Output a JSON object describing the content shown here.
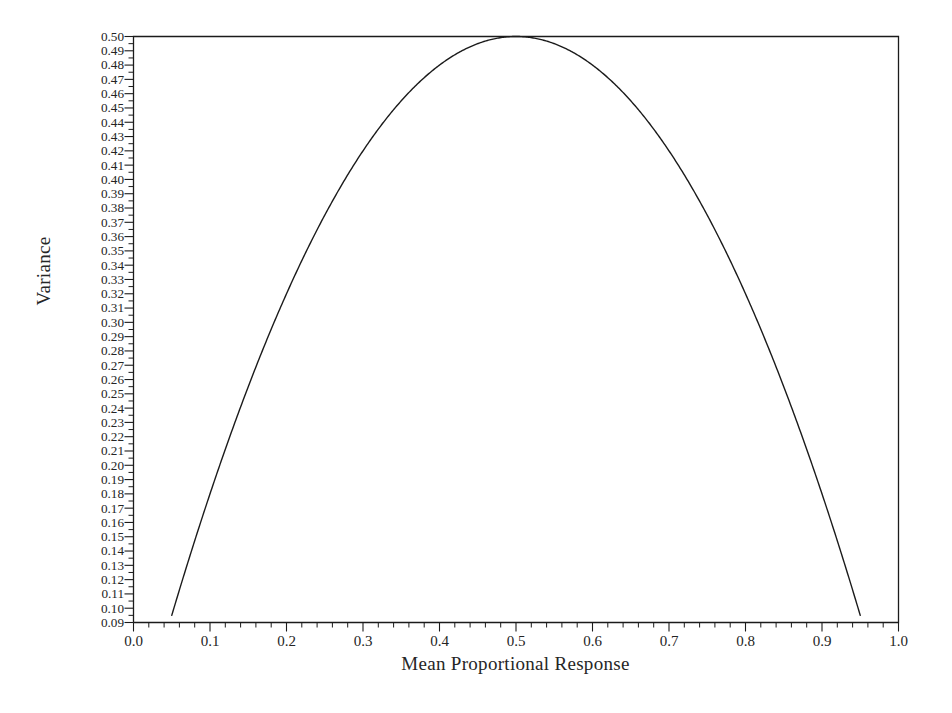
{
  "chart_data": {
    "type": "line",
    "title": "",
    "xlabel": "Mean Proportional Response",
    "ylabel": "Variance",
    "xlim": [
      0.0,
      1.0
    ],
    "ylim": [
      0.09,
      0.5
    ],
    "grid": false,
    "legend": null,
    "line_color": "#1b1b1b",
    "line_width": 1.4,
    "xticks": [
      0.0,
      0.1,
      0.2,
      0.3,
      0.4,
      0.5,
      0.6,
      0.7,
      0.8,
      0.9,
      1.0
    ],
    "xtick_labels": [
      "0.0",
      "0.1",
      "0.2",
      "0.3",
      "0.4",
      "0.5",
      "0.6",
      "0.7",
      "0.8",
      "0.9",
      "1.0"
    ],
    "x_minor_tick_step": 0.02,
    "yticks": [
      0.5,
      0.49,
      0.48,
      0.47,
      0.46,
      0.45,
      0.44,
      0.43,
      0.42,
      0.41,
      0.4,
      0.39,
      0.38,
      0.37,
      0.36,
      0.35,
      0.34,
      0.33,
      0.32,
      0.31,
      0.3,
      0.29,
      0.28,
      0.27,
      0.26,
      0.25,
      0.24,
      0.23,
      0.22,
      0.21,
      0.2,
      0.19,
      0.18,
      0.17,
      0.16,
      0.15,
      0.14,
      0.13,
      0.12,
      0.11,
      0.1,
      0.09
    ],
    "ytick_labels": [
      "0.50",
      "0.49",
      "0.48",
      "0.47",
      "0.46",
      "0.45",
      "0.44",
      "0.43",
      "0.42",
      "0.41",
      "0.40",
      "0.39",
      "0.38",
      "0.37",
      "0.36",
      "0.35",
      "0.34",
      "0.33",
      "0.32",
      "0.31",
      "0.30",
      "0.29",
      "0.28",
      "0.27",
      "0.26",
      "0.25",
      "0.24",
      "0.23",
      "0.22",
      "0.21",
      "0.20",
      "0.19",
      "0.18",
      "0.17",
      "0.16",
      "0.15",
      "0.14",
      "0.13",
      "0.12",
      "0.11",
      "0.10",
      "0.09"
    ],
    "y_minor_tick_step": 0.005,
    "series": [
      {
        "name": "p(1-p)",
        "x": [
          0.05,
          0.06,
          0.07,
          0.08,
          0.09,
          0.1,
          0.11,
          0.12,
          0.13,
          0.14,
          0.15,
          0.16,
          0.17,
          0.18,
          0.19,
          0.2,
          0.21,
          0.22,
          0.23,
          0.24,
          0.25,
          0.26,
          0.27,
          0.28,
          0.29,
          0.3,
          0.31,
          0.32,
          0.33,
          0.34,
          0.35,
          0.36,
          0.37,
          0.38,
          0.39,
          0.4,
          0.41,
          0.42,
          0.43,
          0.44,
          0.45,
          0.46,
          0.47,
          0.48,
          0.49,
          0.5,
          0.51,
          0.52,
          0.53,
          0.54,
          0.55,
          0.56,
          0.57,
          0.58,
          0.59,
          0.6,
          0.61,
          0.62,
          0.63,
          0.64,
          0.65,
          0.66,
          0.67,
          0.68,
          0.69,
          0.7,
          0.71,
          0.72,
          0.73,
          0.74,
          0.75,
          0.76,
          0.77,
          0.78,
          0.79,
          0.8,
          0.81,
          0.82,
          0.83,
          0.84,
          0.85,
          0.86,
          0.87,
          0.88,
          0.89,
          0.9,
          0.91,
          0.92,
          0.93,
          0.94,
          0.95
        ],
        "y": [
          0.095,
          0.0564,
          0.0651,
          0.0736,
          0.0819,
          0.09,
          0.0979,
          0.1056,
          0.1131,
          0.1204,
          0.1275,
          0.1344,
          0.1411,
          0.1476,
          0.1539,
          0.16,
          0.1659,
          0.1716,
          0.1771,
          0.1824,
          0.1875,
          0.1924,
          0.1971,
          0.2016,
          0.2059,
          0.21,
          0.2139,
          0.2176,
          0.2211,
          0.2244,
          0.2275,
          0.2304,
          0.2331,
          0.2356,
          0.2379,
          0.24,
          0.2419,
          0.2436,
          0.2451,
          0.2464,
          0.2475,
          0.2484,
          0.2491,
          0.2496,
          0.2499,
          0.25,
          0.2499,
          0.2496,
          0.2491,
          0.2484,
          0.2475,
          0.2464,
          0.2451,
          0.2436,
          0.2419,
          0.24,
          0.2379,
          0.2356,
          0.2331,
          0.2304,
          0.2275,
          0.2244,
          0.2211,
          0.2176,
          0.2139,
          0.21,
          0.2059,
          0.2016,
          0.1971,
          0.1924,
          0.1875,
          0.1824,
          0.1771,
          0.1716,
          0.1659,
          0.16,
          0.1539,
          0.1476,
          0.1411,
          0.1344,
          0.1275,
          0.1204,
          0.1131,
          0.1056,
          0.0979,
          0.09,
          0.0819,
          0.0736,
          0.0651,
          0.0564,
          0.095
        ],
        "note": "Plotted curve is 2 * p * (1 - p) scaled to the 0.09-0.50 axis; endpoints at p=0.05 and p=0.95 sit at 0.095.",
        "plotted_y": [
          0.095,
          0.1128,
          0.1302,
          0.1472,
          0.1638,
          0.18,
          0.1958,
          0.2112,
          0.2262,
          0.2408,
          0.255,
          0.2688,
          0.2822,
          0.2952,
          0.3078,
          0.32,
          0.3318,
          0.3432,
          0.3542,
          0.3648,
          0.375,
          0.3848,
          0.3942,
          0.4032,
          0.4118,
          0.42,
          0.4278,
          0.4352,
          0.4422,
          0.4488,
          0.455,
          0.4608,
          0.4662,
          0.4712,
          0.4758,
          0.48,
          0.4838,
          0.4872,
          0.4902,
          0.4928,
          0.495,
          0.4968,
          0.4982,
          0.4992,
          0.4998,
          0.5,
          0.4998,
          0.4992,
          0.4982,
          0.4968,
          0.495,
          0.4928,
          0.4902,
          0.4872,
          0.4838,
          0.48,
          0.4758,
          0.4712,
          0.4662,
          0.4608,
          0.455,
          0.4488,
          0.4422,
          0.4352,
          0.4278,
          0.42,
          0.4118,
          0.4032,
          0.3942,
          0.3848,
          0.375,
          0.3648,
          0.3542,
          0.3432,
          0.3318,
          0.32,
          0.3078,
          0.2952,
          0.2822,
          0.2688,
          0.255,
          0.2408,
          0.2262,
          0.2112,
          0.1958,
          0.18,
          0.1638,
          0.1472,
          0.1302,
          0.1128,
          0.095
        ]
      }
    ]
  },
  "axes": {
    "frame_color": "#1b1b1b",
    "tick_color": "#1b1b1b"
  }
}
